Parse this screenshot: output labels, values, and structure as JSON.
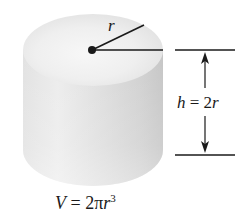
{
  "figure": {
    "radius_label": "r",
    "height_label": {
      "var": "h",
      "eq": " = 2",
      "var2": "r"
    },
    "volume_label": {
      "var": "V",
      "eq": " = 2π",
      "var2": "r",
      "exponent": "3"
    },
    "colors": {
      "cylinder_light": "#f4f4f4",
      "cylinder_mid": "#dcdcdc",
      "cylinder_dark": "#c4c4c4",
      "line": "#1a1a1a"
    }
  }
}
